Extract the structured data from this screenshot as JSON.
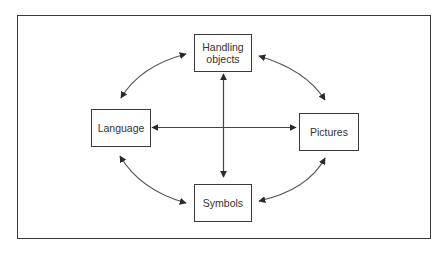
{
  "diagram": {
    "type": "relationship-cycle",
    "nodes": {
      "top": {
        "line1": "Handling",
        "line2": "objects"
      },
      "left": {
        "label": "Language"
      },
      "right": {
        "label": "Pictures"
      },
      "bottom": {
        "label": "Symbols"
      }
    },
    "edges": [
      {
        "from": "Handling objects",
        "to": "Language",
        "style": "curved",
        "direction": "bidirectional"
      },
      {
        "from": "Handling objects",
        "to": "Pictures",
        "style": "curved",
        "direction": "bidirectional"
      },
      {
        "from": "Language",
        "to": "Symbols",
        "style": "curved",
        "direction": "bidirectional"
      },
      {
        "from": "Pictures",
        "to": "Symbols",
        "style": "curved",
        "direction": "bidirectional"
      },
      {
        "from": "Handling objects",
        "to": "Symbols",
        "style": "straight",
        "direction": "bidirectional"
      },
      {
        "from": "Language",
        "to": "Pictures",
        "style": "straight",
        "direction": "bidirectional"
      }
    ],
    "colors": {
      "stroke": "#3a3a3a",
      "text": "#333333",
      "background": "#ffffff"
    }
  }
}
